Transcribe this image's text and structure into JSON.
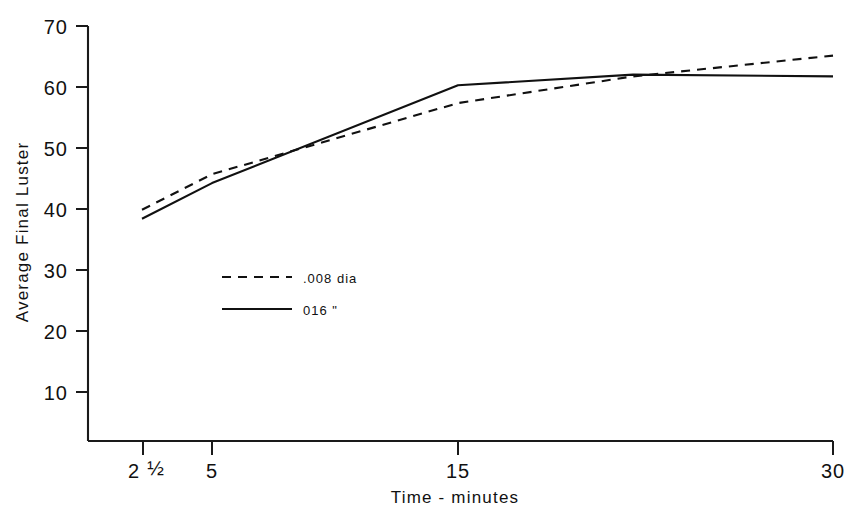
{
  "chart_data": {
    "type": "line",
    "title": "",
    "subtitle": "",
    "xlabel": "Time - minutes",
    "ylabel": "Average Final Luster",
    "x_tick_labels": [
      "2 ½",
      "5",
      "15",
      "30"
    ],
    "x_tick_values": [
      2.5,
      5,
      15,
      30
    ],
    "y_tick_labels": [
      "10",
      "20",
      "30",
      "40",
      "50",
      "60",
      "70"
    ],
    "y_tick_values": [
      10,
      20,
      30,
      40,
      50,
      60,
      70
    ],
    "ylim": [
      0,
      70
    ],
    "xlim": [
      2.5,
      30
    ],
    "grid": false,
    "legend_position": "center-left",
    "series": [
      {
        "name": ".008 dia",
        "style": "dashed",
        "color": "#111111",
        "x": [
          2.5,
          5,
          15,
          22,
          30
        ],
        "values": [
          39,
          45,
          57,
          61.5,
          65
        ]
      },
      {
        "name": "016  \"",
        "style": "solid",
        "color": "#111111",
        "x": [
          2.5,
          5,
          15,
          22,
          30
        ],
        "values": [
          37.5,
          43.5,
          60,
          61.8,
          61.5
        ]
      }
    ],
    "legend_entries": [
      {
        "label": ".008 dia",
        "style": "dashed"
      },
      {
        "label": "016  \"",
        "style": "solid"
      }
    ]
  },
  "axes": {
    "y_label": "Average Final Luster",
    "x_label": "Time - minutes",
    "y_ticks": [
      {
        "label": "70"
      },
      {
        "label": "60"
      },
      {
        "label": "50"
      },
      {
        "label": "40"
      },
      {
        "label": "30"
      },
      {
        "label": "20"
      },
      {
        "label": "10"
      }
    ],
    "x_ticks": [
      {
        "label_whole": "2",
        "label_frac": "½",
        "label": "2 ½"
      },
      {
        "label": "5"
      },
      {
        "label": "15"
      },
      {
        "label": "30"
      }
    ]
  },
  "legend": {
    "items": [
      {
        "label": ".008 dia"
      },
      {
        "label": "016   \""
      }
    ]
  },
  "colors": {
    "background": "#ffffff",
    "ink": "#111111",
    "axis": "#1a1a1a"
  }
}
